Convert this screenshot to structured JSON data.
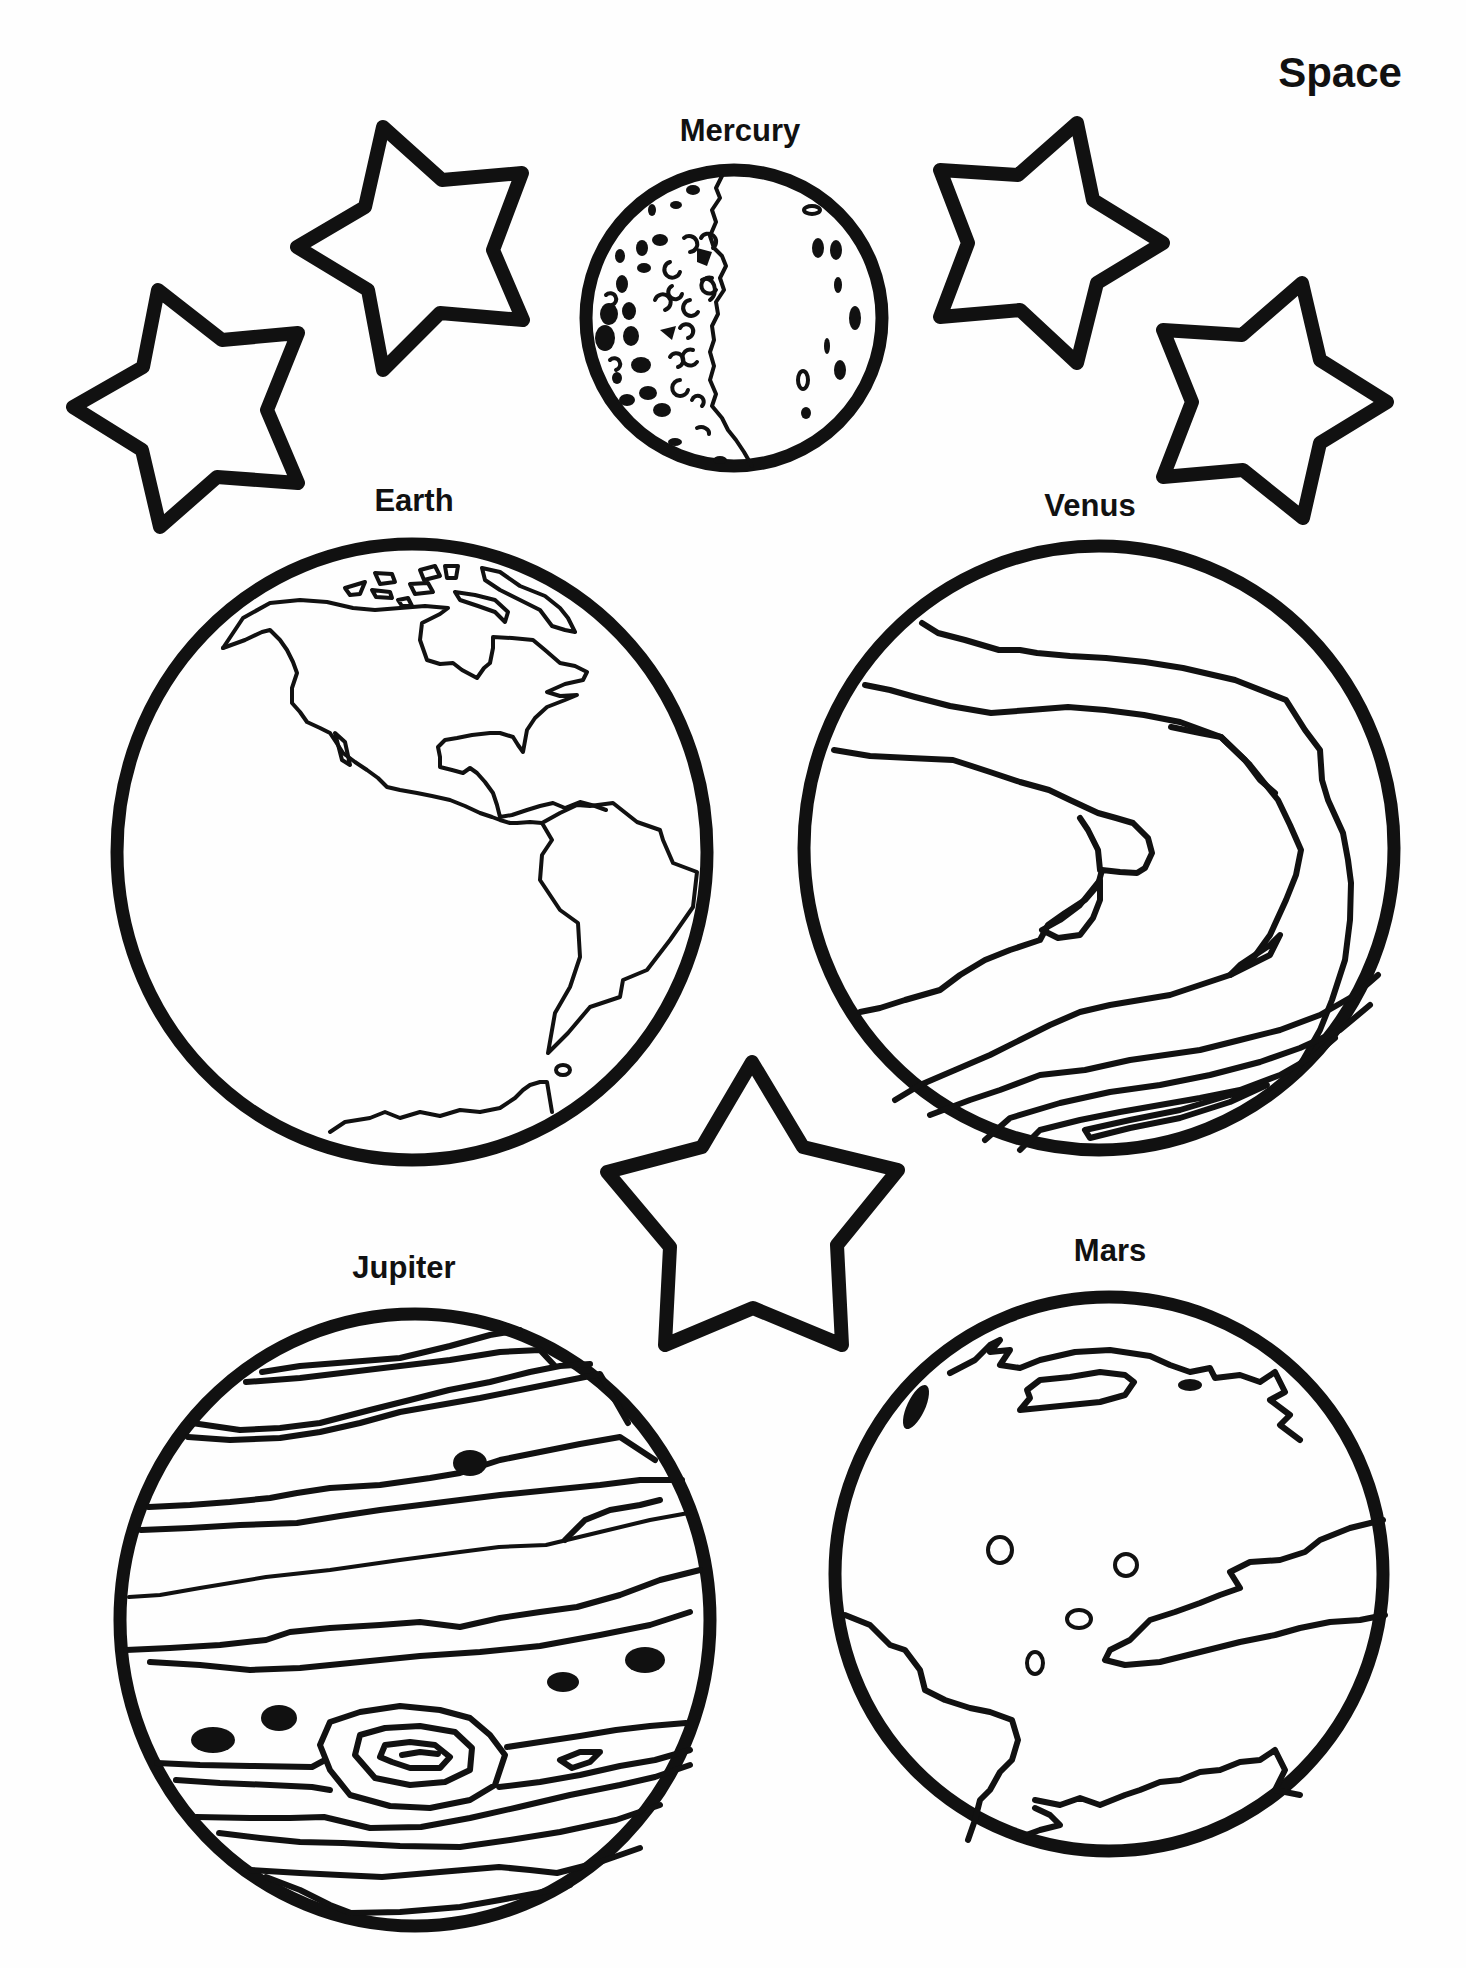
{
  "page": {
    "title": "Space",
    "type": "coloring page",
    "ink_color": "#111111",
    "paper_color": "#fefefe"
  },
  "planets": [
    {
      "key": "mercury",
      "name": "Mercury",
      "features": "cratered crescent"
    },
    {
      "key": "earth",
      "name": "Earth",
      "features": "North and South America outlines"
    },
    {
      "key": "venus",
      "name": "Venus",
      "features": "swirling cloud bands"
    },
    {
      "key": "jupiter",
      "name": "Jupiter",
      "features": "horizontal bands, dark spots, Great Red Spot swirl"
    },
    {
      "key": "mars",
      "name": "Mars",
      "features": "polar cap, craters, dark terrain"
    }
  ],
  "stars": [
    {
      "key": "star-left-lower"
    },
    {
      "key": "star-left-upper"
    },
    {
      "key": "star-right-upper"
    },
    {
      "key": "star-right-lower"
    },
    {
      "key": "star-center"
    }
  ]
}
